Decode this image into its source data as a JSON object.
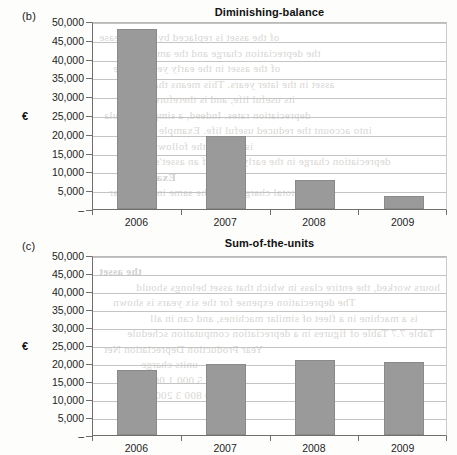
{
  "figures": [
    {
      "panel": "(b)",
      "title": "Diminishing-balance",
      "currency_symbol": "€"
    },
    {
      "panel": "(c)",
      "title": "Sum-of-the-units",
      "currency_symbol": "€"
    }
  ],
  "axis": {
    "y_ticks": [
      "50,000",
      "45,000",
      "40,000",
      "35,000",
      "30,000",
      "25,000",
      "20,000",
      "15,000",
      "10,000",
      "5,000",
      "–"
    ],
    "x_ticks": [
      "2006",
      "2007",
      "2008",
      "2009"
    ]
  },
  "colors": {
    "bar_fill": "#9a9a9a",
    "bar_stroke": "#8a8a8a",
    "gridline": "#c4c4c4",
    "axis": "#6f6f6f",
    "plot_background": "#ffffff",
    "page_background": "#fdfdfc",
    "bleed_text": "#b9b5b0"
  },
  "bleed_text_b": [
    "of the asset is replaced by the increase",
    "the depreciation charge and the amount",
    "of the asset in the early years of the",
    "asset in the later years. This means that",
    "its useful life, and is therefore more",
    "depreciation rates. Indeed, a simple formula",
    "into account the reduced useful life. Example 7.7",
    "is used in the following way.",
    "depreciation charge in the early years of an asset's",
    "Example",
    "the total charge to be the same in each year"
  ],
  "bleed_text_c": [
    "the asset",
    "hours worked, the entire class in which that asset belongs should",
    "The depreciation expense for the six years is shown",
    "is a machine in a fleet of similar machines, and can in all",
    "Table 7.7 Table of figures in a depreciation computation schedule",
    "Year         Production         Depreciation       Net",
    "units              charge",
    "1                 5 000                1 000            4 000",
    "2                 4 000                  800            3 200"
  ],
  "chart_data": [
    {
      "type": "bar",
      "panel": "(b)",
      "title": "Diminishing-balance",
      "categories": [
        "2006",
        "2007",
        "2008",
        "2009"
      ],
      "values": [
        48000,
        19300,
        7700,
        3400
      ],
      "xlabel": "",
      "ylabel": "€",
      "ylim": [
        0,
        50000
      ],
      "ytick_step": 5000,
      "grid": true,
      "legend": "none"
    },
    {
      "type": "bar",
      "panel": "(c)",
      "title": "Sum-of-the-units",
      "categories": [
        "2006",
        "2007",
        "2008",
        "2009"
      ],
      "values": [
        18100,
        19700,
        20700,
        20400
      ],
      "xlabel": "",
      "ylabel": "€",
      "ylim": [
        0,
        50000
      ],
      "ytick_step": 5000,
      "grid": true,
      "legend": "none"
    }
  ]
}
